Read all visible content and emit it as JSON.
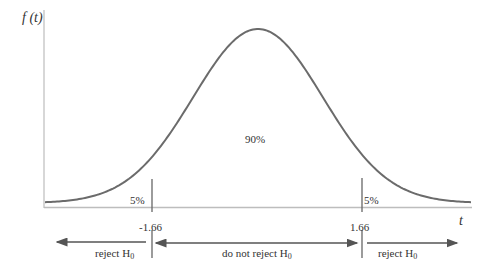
{
  "chart_data": {
    "type": "area",
    "title": "",
    "xlabel": "t",
    "ylabel": "f(t)",
    "distribution": "t-distribution density (bell curve), one-tailed regions shown on both sides",
    "critical_values": [
      -1.66,
      1.66
    ],
    "regions": [
      {
        "name": "left tail",
        "label": "5%",
        "range": [
          "-inf",
          -1.66
        ]
      },
      {
        "name": "center",
        "label": "90%",
        "range": [
          -1.66,
          1.66
        ]
      },
      {
        "name": "right tail",
        "label": "5%",
        "range": [
          1.66,
          "inf"
        ]
      }
    ],
    "decision_arrows": [
      {
        "label": "reject H0",
        "direction": "left",
        "range": [
          "-inf",
          -1.66
        ]
      },
      {
        "label": "do not reject H0",
        "direction": "both",
        "range": [
          -1.66,
          1.66
        ]
      },
      {
        "label": "reject H0",
        "direction": "right",
        "range": [
          1.66,
          "inf"
        ]
      }
    ],
    "grid": false,
    "legend": "none"
  },
  "labels": {
    "y_axis": "f (t)",
    "x_axis": "t",
    "left_tail_pct": "5%",
    "center_pct": "90%",
    "right_tail_pct": "5%",
    "left_crit": "-1.66",
    "right_crit": "1.66",
    "left_decision": "reject H",
    "center_decision": "do not reject H",
    "right_decision": "reject H",
    "subscript": "0"
  },
  "colors": {
    "curve": "#6b6b6b",
    "axis": "#b5b5b5",
    "lines": "#555555"
  }
}
